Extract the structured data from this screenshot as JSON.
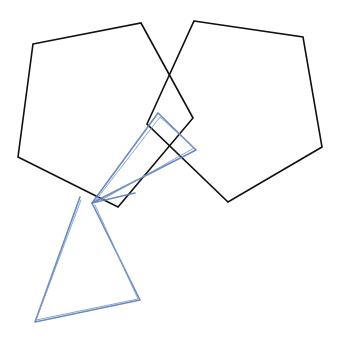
{
  "canvas": {
    "width": 338,
    "height": 340,
    "background": "#ffffff"
  },
  "colors": {
    "black_stroke": "#111111",
    "blue_stroke": "#5b7db8"
  },
  "shapes": {
    "left_pentagon": {
      "points": "33,44 141,23 193,118 118,207 18,157"
    },
    "right_pentagon": {
      "points": "194,21 303,37 322,147 228,202 147,124"
    },
    "blue_upper_loop": {
      "points": "92,203 158,113 196,150 92,203 135,193"
    },
    "blue_upper_loop_b": {
      "points": "96,200 160,117 194,148 98,202"
    },
    "blue_lower_triangle": {
      "points": "80,197 35,322 140,300 92,203"
    },
    "blue_lower_triangle_b": {
      "points": "81,200 36,320 138,299 95,205"
    }
  }
}
